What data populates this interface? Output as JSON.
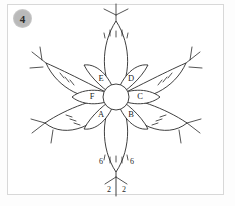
{
  "figure": {
    "number_badge": "4",
    "badge_color": "#b9b9b9",
    "stroke_color": "#2a2a2a",
    "background": "#ffffff",
    "border_color": "#d8d8d8",
    "title": "",
    "type": "floral-diagram"
  },
  "inner_petals": [
    {
      "id": "A",
      "label": "A",
      "angle_deg": 210
    },
    {
      "id": "B",
      "label": "B",
      "angle_deg": 150
    },
    {
      "id": "C",
      "label": "C",
      "angle_deg": 90
    },
    {
      "id": "D",
      "label": "D",
      "angle_deg": 30
    },
    {
      "id": "E",
      "label": "E",
      "angle_deg": 330
    },
    {
      "id": "F",
      "label": "F",
      "angle_deg": 270
    }
  ],
  "outer_petals": [
    {
      "id": "outer-top",
      "angle_deg": 0
    },
    {
      "id": "outer-upper-right",
      "angle_deg": 60
    },
    {
      "id": "outer-lower-right",
      "angle_deg": 120
    },
    {
      "id": "outer-bottom",
      "angle_deg": 180
    },
    {
      "id": "outer-lower-left",
      "angle_deg": 240
    },
    {
      "id": "outer-upper-left",
      "angle_deg": 300
    }
  ],
  "annotations": {
    "count_left": "6",
    "count_right": "6",
    "stem_left": "2",
    "stem_right": "2"
  },
  "center": {
    "label": ""
  }
}
